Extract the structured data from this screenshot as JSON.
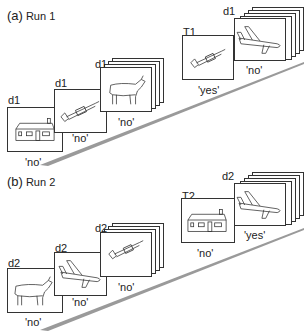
{
  "panels": [
    {
      "id": "a",
      "letter": "(a)",
      "run": "Run 1",
      "frames": [
        {
          "tag": "d1",
          "picture": "house",
          "response": "'no'"
        },
        {
          "tag": "d1",
          "picture": "trumpet",
          "response": "'no'"
        },
        {
          "tag": "d1",
          "picture": "goat",
          "response": "'no'"
        },
        {
          "tag": "T1",
          "picture": "trumpet",
          "response": "'yes'"
        },
        {
          "tag": "d1",
          "picture": "airplane",
          "response": "'no'"
        }
      ]
    },
    {
      "id": "b",
      "letter": "(b)",
      "run": "Run 2",
      "frames": [
        {
          "tag": "d2",
          "picture": "goat",
          "response": "'no'"
        },
        {
          "tag": "d2",
          "picture": "airplane",
          "response": "'no'"
        },
        {
          "tag": "d2",
          "picture": "trumpet",
          "response": "'no'"
        },
        {
          "tag": "T2",
          "picture": "house",
          "response": "'no'"
        },
        {
          "tag": "d2",
          "picture": "airplane",
          "response": "'yes'"
        }
      ]
    }
  ],
  "colors": {
    "line": "#333333",
    "wedge": "#9a9a9a",
    "background": "#ffffff"
  }
}
